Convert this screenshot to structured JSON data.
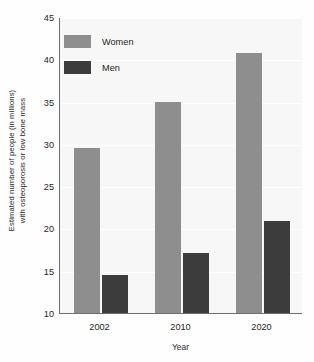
{
  "chart_data": {
    "type": "bar",
    "title": "",
    "xlabel": "Year",
    "ylabel_lines": [
      "Estimated number of people (in millions)",
      "with osteoporosis or low bone mass"
    ],
    "categories": [
      "2002",
      "2010",
      "2020"
    ],
    "series": [
      {
        "name": "Women",
        "color": "#8e8e8e",
        "values": [
          29.5,
          35.0,
          40.8
        ]
      },
      {
        "name": "Men",
        "color": "#3c3c3c",
        "values": [
          14.5,
          17.1,
          20.9
        ]
      }
    ],
    "ylim": [
      10,
      45
    ],
    "yticks": [
      10,
      15,
      20,
      25,
      30,
      35,
      40,
      45
    ],
    "ytick_labels": [
      "10",
      "15",
      "20",
      "25",
      "30",
      "35",
      "40",
      "45"
    ],
    "grid": true,
    "legend_position": "top-left",
    "legend": [
      "Women",
      "Men"
    ]
  },
  "colors": {
    "women": "#8e8e8e",
    "men": "#3c3c3c",
    "axis": "#6d6d6d",
    "plot_background": "#f7f7f7",
    "text": "#1d1d1d"
  }
}
